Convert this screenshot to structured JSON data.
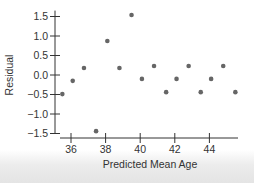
{
  "chart_data": {
    "type": "scatter",
    "title": "",
    "xlabel": "Predicted Mean Age",
    "ylabel": "Residual",
    "xlim": [
      35.2,
      45.8
    ],
    "ylim": [
      -1.5,
      1.6
    ],
    "xticks": [
      36,
      38,
      40,
      42,
      44
    ],
    "yticks": [
      1.5,
      1.0,
      0.5,
      0.0,
      -0.5,
      -1.0,
      -1.5
    ],
    "ytick_labels": [
      "1.5",
      "1.0",
      "0.5",
      "0.0",
      "−0.5",
      "−1.0",
      "−1.5"
    ],
    "grid": false,
    "legend": null,
    "point_color": "#666666",
    "points": [
      {
        "x": 35.5,
        "y": -0.49
      },
      {
        "x": 36.1,
        "y": -0.15
      },
      {
        "x": 36.75,
        "y": 0.18
      },
      {
        "x": 37.45,
        "y": -1.44
      },
      {
        "x": 38.1,
        "y": 0.87
      },
      {
        "x": 38.8,
        "y": 0.18
      },
      {
        "x": 39.5,
        "y": 1.54
      },
      {
        "x": 40.1,
        "y": -0.1
      },
      {
        "x": 40.8,
        "y": 0.23
      },
      {
        "x": 41.5,
        "y": -0.44
      },
      {
        "x": 42.1,
        "y": -0.1
      },
      {
        "x": 42.8,
        "y": 0.23
      },
      {
        "x": 43.5,
        "y": -0.44
      },
      {
        "x": 44.1,
        "y": -0.1
      },
      {
        "x": 44.8,
        "y": 0.23
      },
      {
        "x": 45.5,
        "y": -0.44
      }
    ]
  }
}
